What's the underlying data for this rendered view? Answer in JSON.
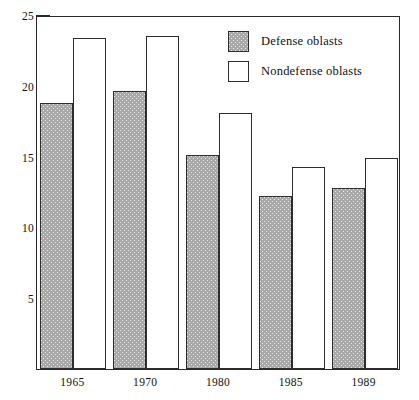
{
  "chart_data": {
    "type": "bar",
    "title": "",
    "subtitle": "",
    "xlabel": "",
    "ylabel": "",
    "categories": [
      "1965",
      "1970",
      "1980",
      "1985",
      "1989"
    ],
    "series": [
      {
        "name": "Defense oblasts",
        "values": [
          18.8,
          19.6,
          15.1,
          12.2,
          12.8
        ],
        "fill": "#a8a8a8",
        "pattern": "stippled"
      },
      {
        "name": "Nondefense oblasts",
        "values": [
          23.4,
          23.5,
          18.1,
          14.3,
          14.9
        ],
        "fill": "#ffffff",
        "pattern": "solid"
      }
    ],
    "ylim": [
      0,
      25
    ],
    "yticks": [
      5,
      10,
      15,
      20,
      25
    ],
    "ytick_labels": [
      "5",
      "10",
      "15",
      "20",
      "25"
    ],
    "grid": false,
    "legend_position": "top-right",
    "frame": true,
    "axis_color": "#2a2a2a"
  },
  "legend": {
    "items": [
      {
        "label": "Defense oblasts"
      },
      {
        "label": "Nondefense oblasts"
      }
    ]
  }
}
